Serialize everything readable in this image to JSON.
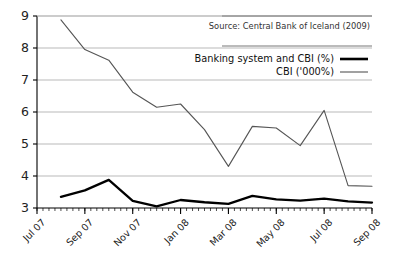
{
  "chart_data": {
    "type": "line",
    "title": "",
    "subtitle": "",
    "xlabel": "",
    "ylabel": "",
    "ylim": [
      3,
      9
    ],
    "yticks": [
      3,
      4,
      5,
      6,
      7,
      8,
      9
    ],
    "ytick_labels": [
      "3",
      "4",
      "5",
      "6",
      "7",
      "8",
      "9"
    ],
    "grid": true,
    "grid_axis": "y",
    "legend_position": "top-right",
    "annotation": "Source: Central Bank of Iceland (2009)",
    "x": [
      "Jul 07",
      "Aug 07",
      "Sep 07",
      "Oct 07",
      "Nov 07",
      "Dec 07",
      "Jan 08",
      "Feb 08",
      "Mar 08",
      "Apr 08",
      "May 08",
      "Jun 08",
      "Jul 08",
      "Aug 08",
      "Sep 08"
    ],
    "xtick_labels": [
      "Jul 07",
      "Sep 07",
      "Nov 07",
      "Jan 08",
      "Mar 08",
      "May 08",
      "Jul 08",
      "Sep 08"
    ],
    "xtick_indices": [
      0,
      2,
      4,
      6,
      8,
      10,
      12,
      14
    ],
    "series": [
      {
        "name": "Banking system and CBI (%)",
        "color": "#000000",
        "width": 2.3,
        "values": [
          null,
          3.35,
          3.55,
          3.88,
          3.22,
          3.05,
          3.25,
          3.18,
          3.13,
          3.38,
          3.27,
          3.23,
          3.29,
          3.21,
          3.17
        ]
      },
      {
        "name": "CBI ('000%)",
        "color": "#555555",
        "width": 1.1,
        "values": [
          null,
          8.88,
          7.95,
          7.62,
          6.62,
          6.15,
          6.25,
          5.45,
          4.3,
          5.55,
          5.5,
          4.95,
          6.05,
          3.7,
          3.68
        ]
      }
    ]
  },
  "axes": {
    "y_tick_values": [
      "3",
      "4",
      "5",
      "6",
      "7",
      "8",
      "9"
    ],
    "x_tick_values": [
      "Jul 07",
      "Sep 07",
      "Nov 07",
      "Jan 08",
      "Mar 08",
      "May 08",
      "Jul 08",
      "Sep 08"
    ]
  },
  "legend": {
    "items": [
      {
        "label": "Banking system and CBI (%)"
      },
      {
        "label": "CBI ('000%)"
      }
    ]
  },
  "source": {
    "text": "Source: Central Bank of Iceland (2009)"
  },
  "colors": {
    "series_primary": "#000000",
    "series_secondary": "#555555",
    "gridline": "#b9b9b9",
    "axis": "#000000",
    "background": "#ffffff"
  }
}
